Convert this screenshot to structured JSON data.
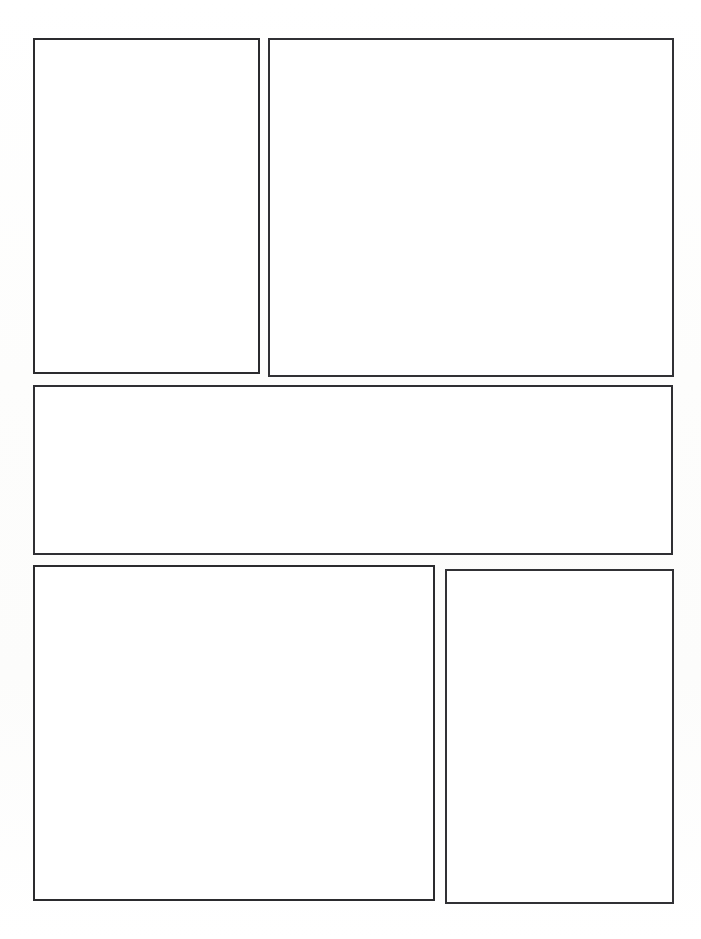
{
  "page": {
    "kind": "comic-page-template",
    "width_px": 701,
    "height_px": 939,
    "background_color": "#ffffff",
    "ink_color": "#2e2e31",
    "border_width_px": 2,
    "orientation": "portrait",
    "content_text": "",
    "margins": {
      "left_px": 33,
      "right_px": 27,
      "top_px": 38,
      "bottom_px": 35
    },
    "gutters": {
      "horizontal_px": 10,
      "vertical_px": 11
    }
  },
  "layout": {
    "rows": 3,
    "panel_count": 5,
    "row_labels": [
      "row-1",
      "row-2",
      "row-3"
    ],
    "row_1_panels": 2,
    "row_2_panels": 1,
    "row_3_panels": 2
  },
  "panels": [
    {
      "id": "panel-1",
      "label": "Panel 1",
      "row": 1,
      "column": 1,
      "x": 33,
      "y": 38,
      "width": 227,
      "height": 336,
      "caption": "",
      "content": ""
    },
    {
      "id": "panel-2",
      "label": "Panel 2",
      "row": 1,
      "column": 2,
      "x": 268,
      "y": 38,
      "width": 406,
      "height": 339,
      "caption": "",
      "content": ""
    },
    {
      "id": "panel-3",
      "label": "Panel 3",
      "row": 2,
      "column": 1,
      "x": 33,
      "y": 385,
      "width": 640,
      "height": 170,
      "caption": "",
      "content": ""
    },
    {
      "id": "panel-4",
      "label": "Panel 4",
      "row": 3,
      "column": 1,
      "x": 33,
      "y": 565,
      "width": 402,
      "height": 336,
      "caption": "",
      "content": ""
    },
    {
      "id": "panel-5",
      "label": "Panel 5",
      "row": 3,
      "column": 2,
      "x": 445,
      "y": 569,
      "width": 229,
      "height": 335,
      "caption": "",
      "content": ""
    }
  ]
}
